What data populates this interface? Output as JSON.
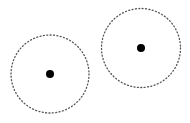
{
  "canvas": {
    "width": 190,
    "height": 123,
    "background": "#ffffff"
  },
  "circles": [
    {
      "cx": 50,
      "cy": 74,
      "r": 39,
      "stroke": "#555555",
      "dot_r": 4,
      "dot_color": "#000000"
    },
    {
      "cx": 141,
      "cy": 48,
      "r": 39.5,
      "stroke": "#555555",
      "dot_r": 4,
      "dot_color": "#000000"
    }
  ]
}
